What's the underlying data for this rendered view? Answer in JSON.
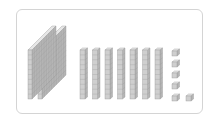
{
  "diagram": {
    "type": "base-ten-blocks",
    "hundreds": 2,
    "tens": 7,
    "ones": 6,
    "represented_value": 276,
    "colors": {
      "front": "#cfcfcf",
      "side": "#b5b5b5",
      "top": "#e6e6e6",
      "grid": "#9a9a9a",
      "frame": "#d4d4d4"
    }
  }
}
